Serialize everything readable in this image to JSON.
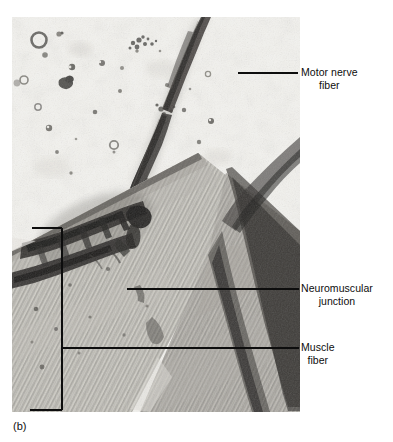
{
  "figure": {
    "caption": "(b)",
    "plate": {
      "x": 12,
      "y": 17,
      "width": 288,
      "height": 395,
      "background_color": "#efefec",
      "tone_dark": "#1b1b1b",
      "tone_mid": "#8f8d88",
      "tone_light": "#e8e7e2"
    }
  },
  "annotations": {
    "ink_color": "#0d0d0d",
    "callouts": [
      {
        "id": "motor-nerve-fiber",
        "line_1": "Motor nerve",
        "line_2": "fiber",
        "leader": {
          "x1": 238,
          "y1": 73,
          "x2": 298,
          "y2": 73
        }
      },
      {
        "id": "neuromuscular-junction",
        "line_1": "Neuromuscular",
        "line_2": "junction",
        "leader": {
          "x1": 127,
          "y1": 289,
          "x2": 299,
          "y2": 289
        }
      },
      {
        "id": "muscle-fiber",
        "line_1": "Muscle",
        "line_2": "fiber",
        "leader": {
          "x1": 62,
          "y1": 348,
          "x2": 299,
          "y2": 348
        }
      }
    ],
    "bracket": {
      "id": "muscle-fiber-extent-bracket",
      "vertical": {
        "x": 62,
        "y1": 228,
        "y2": 410
      },
      "tick_top": {
        "x1": 32,
        "y1": 228,
        "x2": 62,
        "y2": 228
      },
      "tick_bottom": {
        "x1": 30,
        "y1": 410,
        "x2": 62,
        "y2": 410
      }
    }
  }
}
